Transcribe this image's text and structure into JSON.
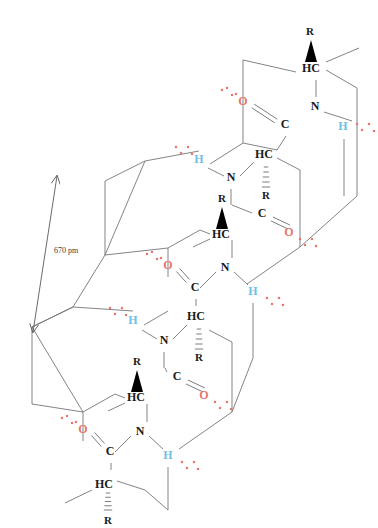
{
  "figure": {
    "type": "chemical-structure-diagram",
    "background_color": "#ffffff"
  },
  "colors": {
    "bond": "#6e6e72",
    "atom_carbon": "#1a1a1a",
    "atom_nitrogen": "#1a1a1a",
    "atom_oxygen": "#e8766d",
    "atom_hydrogen_bonded": "#6fc0e8",
    "lone_pair_dot": "#e8766d",
    "wedge": "#000000",
    "dimension_line": "#5a5a5a",
    "dimension_text": "#3a3a3a"
  },
  "dimension": {
    "label": "670 pm",
    "arrow_style": "double-headed",
    "from": [
      57,
      176
    ],
    "to": [
      33,
      332
    ]
  },
  "labels": {
    "R": "R",
    "HC": "HC",
    "C": "C",
    "N": "N",
    "O": "O",
    "H": "H"
  },
  "atoms": [
    {
      "id": "a1_R",
      "text": "R",
      "kind": "sidechain",
      "x": 310,
      "y": 32,
      "color": "#1a1a1a",
      "size": 11
    },
    {
      "id": "a1_HC",
      "text": "HC",
      "kind": "alpha-carbon",
      "x": 311,
      "y": 69,
      "color": "#1a1a1a",
      "size": 12
    },
    {
      "id": "a1_N",
      "text": "N",
      "kind": "nitrogen",
      "x": 315,
      "y": 107,
      "color": "#1a1a1a",
      "size": 12
    },
    {
      "id": "a1_H",
      "text": "H",
      "kind": "amide-hydrogen",
      "x": 343,
      "y": 127,
      "color": "#6fc0e8",
      "size": 12
    },
    {
      "id": "a1_O",
      "text": "O",
      "kind": "carbonyl-oxygen",
      "x": 243,
      "y": 102,
      "color": "#e8766d",
      "size": 12
    },
    {
      "id": "a1_C",
      "text": "C",
      "kind": "carbonyl-carbon",
      "x": 285,
      "y": 125,
      "color": "#1a1a1a",
      "size": 12
    },
    {
      "id": "a2_H",
      "text": "H",
      "kind": "amide-hydrogen",
      "x": 199,
      "y": 160,
      "color": "#6fc0e8",
      "size": 12
    },
    {
      "id": "a2_HC",
      "text": "HC",
      "kind": "alpha-carbon",
      "x": 264,
      "y": 155,
      "color": "#1a1a1a",
      "size": 12
    },
    {
      "id": "a2_N",
      "text": "N",
      "kind": "nitrogen",
      "x": 231,
      "y": 178,
      "color": "#1a1a1a",
      "size": 12
    },
    {
      "id": "a2_R",
      "text": "R",
      "kind": "sidechain",
      "x": 266,
      "y": 196,
      "color": "#1a1a1a",
      "size": 11
    },
    {
      "id": "a3_R",
      "text": "R",
      "kind": "sidechain",
      "x": 222,
      "y": 199,
      "color": "#1a1a1a",
      "size": 11
    },
    {
      "id": "a3_HC",
      "text": "HC",
      "kind": "alpha-carbon",
      "x": 221,
      "y": 235,
      "color": "#1a1a1a",
      "size": 12
    },
    {
      "id": "a3_C",
      "text": "C",
      "kind": "carbonyl-carbon",
      "x": 262,
      "y": 214,
      "color": "#1a1a1a",
      "size": 12
    },
    {
      "id": "a3_O",
      "text": "O",
      "kind": "carbonyl-oxygen",
      "x": 289,
      "y": 233,
      "color": "#e8766d",
      "size": 12
    },
    {
      "id": "a4_O",
      "text": "O",
      "kind": "carbonyl-oxygen",
      "x": 168,
      "y": 266,
      "color": "#e8766d",
      "size": 12
    },
    {
      "id": "a4_C",
      "text": "C",
      "kind": "carbonyl-carbon",
      "x": 195,
      "y": 288,
      "color": "#1a1a1a",
      "size": 12
    },
    {
      "id": "a4_N",
      "text": "N",
      "kind": "nitrogen",
      "x": 225,
      "y": 268,
      "color": "#1a1a1a",
      "size": 12
    },
    {
      "id": "a4_H",
      "text": "H",
      "kind": "amide-hydrogen",
      "x": 253,
      "y": 292,
      "color": "#6fc0e8",
      "size": 12
    },
    {
      "id": "a5_H",
      "text": "H",
      "kind": "amide-hydrogen",
      "x": 133,
      "y": 321,
      "color": "#6fc0e8",
      "size": 12
    },
    {
      "id": "a5_HC",
      "text": "HC",
      "kind": "alpha-carbon",
      "x": 196,
      "y": 317,
      "color": "#1a1a1a",
      "size": 12
    },
    {
      "id": "a5_N",
      "text": "N",
      "kind": "nitrogen",
      "x": 164,
      "y": 341,
      "color": "#1a1a1a",
      "size": 12
    },
    {
      "id": "a5_R",
      "text": "R",
      "kind": "sidechain",
      "x": 199,
      "y": 358,
      "color": "#1a1a1a",
      "size": 11
    },
    {
      "id": "a6_R",
      "text": "R",
      "kind": "sidechain",
      "x": 137,
      "y": 362,
      "color": "#1a1a1a",
      "size": 11
    },
    {
      "id": "a6_HC",
      "text": "HC",
      "kind": "alpha-carbon",
      "x": 136,
      "y": 398,
      "color": "#1a1a1a",
      "size": 12
    },
    {
      "id": "a6_C",
      "text": "C",
      "kind": "carbonyl-carbon",
      "x": 177,
      "y": 377,
      "color": "#1a1a1a",
      "size": 12
    },
    {
      "id": "a6_O",
      "text": "O",
      "kind": "carbonyl-oxygen",
      "x": 204,
      "y": 396,
      "color": "#e8766d",
      "size": 12
    },
    {
      "id": "a7_O",
      "text": "O",
      "kind": "carbonyl-oxygen",
      "x": 83,
      "y": 430,
      "color": "#e8766d",
      "size": 12
    },
    {
      "id": "a7_C",
      "text": "C",
      "kind": "carbonyl-carbon",
      "x": 110,
      "y": 452,
      "color": "#1a1a1a",
      "size": 12
    },
    {
      "id": "a7_N",
      "text": "N",
      "kind": "nitrogen",
      "x": 140,
      "y": 432,
      "color": "#1a1a1a",
      "size": 12
    },
    {
      "id": "a7_H",
      "text": "H",
      "kind": "amide-hydrogen",
      "x": 168,
      "y": 456,
      "color": "#6fc0e8",
      "size": 12
    },
    {
      "id": "a7_HC",
      "text": "HC",
      "kind": "alpha-carbon",
      "x": 104,
      "y": 485,
      "color": "#1a1a1a",
      "size": 12
    },
    {
      "id": "a7_R",
      "text": "R",
      "kind": "sidechain",
      "x": 108,
      "y": 521,
      "color": "#1a1a1a",
      "size": 11
    }
  ],
  "bonds": [
    {
      "from": [
        243,
        113
      ],
      "to": [
        243,
        60
      ],
      "style": "plain"
    },
    {
      "from": [
        243,
        60
      ],
      "to": [
        296,
        72
      ],
      "style": "plain"
    },
    {
      "from": [
        326,
        62
      ],
      "to": [
        359,
        48
      ],
      "style": "plain"
    },
    {
      "from": [
        316,
        80
      ],
      "to": [
        316,
        97
      ],
      "style": "plain"
    },
    {
      "from": [
        324,
        112
      ],
      "to": [
        352,
        121
      ],
      "style": "plain"
    },
    {
      "from": [
        326,
        70
      ],
      "to": [
        357,
        88
      ],
      "style": "plain"
    },
    {
      "from": [
        357,
        88
      ],
      "to": [
        357,
        196
      ],
      "style": "plain"
    },
    {
      "from": [
        344,
        139
      ],
      "to": [
        344,
        196
      ],
      "style": "plain"
    },
    {
      "from": [
        253,
        106
      ],
      "to": [
        276,
        121
      ],
      "style": "double"
    },
    {
      "from": [
        286,
        136
      ],
      "to": [
        277,
        150
      ],
      "style": "plain"
    },
    {
      "from": [
        243,
        113
      ],
      "to": [
        243,
        143
      ],
      "style": "plain"
    },
    {
      "from": [
        243,
        143
      ],
      "to": [
        277,
        150
      ],
      "style": "plain"
    },
    {
      "from": [
        210,
        164
      ],
      "to": [
        243,
        143
      ],
      "style": "plain"
    },
    {
      "from": [
        208,
        168
      ],
      "to": [
        224,
        176
      ],
      "style": "plain"
    },
    {
      "from": [
        240,
        176
      ],
      "to": [
        254,
        162
      ],
      "style": "plain"
    },
    {
      "from": [
        277,
        158
      ],
      "to": [
        300,
        170
      ],
      "style": "plain"
    },
    {
      "from": [
        266,
        167
      ],
      "to": [
        266,
        187
      ],
      "style": "hashed"
    },
    {
      "from": [
        231,
        189
      ],
      "to": [
        231,
        205
      ],
      "style": "plain"
    },
    {
      "from": [
        232,
        205
      ],
      "to": [
        252,
        213
      ],
      "style": "plain"
    },
    {
      "from": [
        272,
        219
      ],
      "to": [
        289,
        227
      ],
      "style": "double"
    },
    {
      "from": [
        168,
        277
      ],
      "to": [
        168,
        248
      ],
      "style": "plain"
    },
    {
      "from": [
        168,
        248
      ],
      "to": [
        200,
        230
      ],
      "style": "plain"
    },
    {
      "from": [
        200,
        230
      ],
      "to": [
        210,
        234
      ],
      "style": "plain"
    },
    {
      "from": [
        232,
        240
      ],
      "to": [
        232,
        258
      ],
      "style": "plain"
    },
    {
      "from": [
        210,
        239
      ],
      "to": [
        193,
        247
      ],
      "style": "plain"
    },
    {
      "from": [
        300,
        170
      ],
      "to": [
        300,
        247
      ],
      "style": "plain"
    },
    {
      "from": [
        300,
        247
      ],
      "to": [
        357,
        196
      ],
      "style": "plain"
    },
    {
      "from": [
        300,
        247
      ],
      "to": [
        247,
        284
      ],
      "style": "plain"
    },
    {
      "from": [
        178,
        270
      ],
      "to": [
        188,
        281
      ],
      "style": "double"
    },
    {
      "from": [
        196,
        299
      ],
      "to": [
        196,
        306
      ],
      "style": "plain"
    },
    {
      "from": [
        234,
        272
      ],
      "to": [
        248,
        285
      ],
      "style": "plain"
    },
    {
      "from": [
        216,
        272
      ],
      "to": [
        200,
        288
      ],
      "style": "plain"
    },
    {
      "from": [
        253,
        303
      ],
      "to": [
        253,
        358
      ],
      "style": "plain"
    },
    {
      "from": [
        144,
        325
      ],
      "to": [
        168,
        311
      ],
      "style": "plain"
    },
    {
      "from": [
        142,
        330
      ],
      "to": [
        157,
        339
      ],
      "style": "plain"
    },
    {
      "from": [
        173,
        339
      ],
      "to": [
        187,
        325
      ],
      "style": "plain"
    },
    {
      "from": [
        209,
        330
      ],
      "to": [
        232,
        342
      ],
      "style": "plain"
    },
    {
      "from": [
        199,
        329
      ],
      "to": [
        199,
        349
      ],
      "style": "hashed"
    },
    {
      "from": [
        164,
        352
      ],
      "to": [
        164,
        368
      ],
      "style": "plain"
    },
    {
      "from": [
        165,
        368
      ],
      "to": [
        167,
        372
      ],
      "style": "plain"
    },
    {
      "from": [
        187,
        382
      ],
      "to": [
        204,
        390
      ],
      "style": "double"
    },
    {
      "from": [
        83,
        441
      ],
      "to": [
        83,
        412
      ],
      "style": "plain"
    },
    {
      "from": [
        83,
        412
      ],
      "to": [
        115,
        394
      ],
      "style": "plain"
    },
    {
      "from": [
        115,
        394
      ],
      "to": [
        125,
        398
      ],
      "style": "plain"
    },
    {
      "from": [
        147,
        404
      ],
      "to": [
        147,
        422
      ],
      "style": "plain"
    },
    {
      "from": [
        125,
        403
      ],
      "to": [
        108,
        411
      ],
      "style": "plain"
    },
    {
      "from": [
        232,
        342
      ],
      "to": [
        232,
        412
      ],
      "style": "plain"
    },
    {
      "from": [
        232,
        412
      ],
      "to": [
        179,
        449
      ],
      "style": "plain"
    },
    {
      "from": [
        232,
        412
      ],
      "to": [
        253,
        358
      ],
      "style": "plain"
    },
    {
      "from": [
        93,
        434
      ],
      "to": [
        103,
        445
      ],
      "style": "double"
    },
    {
      "from": [
        111,
        463
      ],
      "to": [
        111,
        470
      ],
      "style": "plain"
    },
    {
      "from": [
        149,
        436
      ],
      "to": [
        163,
        449
      ],
      "style": "plain"
    },
    {
      "from": [
        131,
        436
      ],
      "to": [
        115,
        452
      ],
      "style": "plain"
    },
    {
      "from": [
        168,
        467
      ],
      "to": [
        168,
        510
      ],
      "style": "plain"
    },
    {
      "from": [
        117,
        481
      ],
      "to": [
        145,
        490
      ],
      "style": "plain"
    },
    {
      "from": [
        92,
        490
      ],
      "to": [
        65,
        503
      ],
      "style": "plain"
    },
    {
      "from": [
        108,
        493
      ],
      "to": [
        108,
        510
      ],
      "style": "hashed"
    },
    {
      "from": [
        145,
        490
      ],
      "to": [
        168,
        510
      ],
      "style": "plain"
    },
    {
      "from": [
        105,
        181
      ],
      "to": [
        145,
        161
      ],
      "style": "plain"
    },
    {
      "from": [
        105,
        181
      ],
      "to": [
        105,
        255
      ],
      "style": "plain"
    },
    {
      "from": [
        105,
        255
      ],
      "to": [
        145,
        161
      ],
      "style": "plain"
    },
    {
      "from": [
        105,
        255
      ],
      "to": [
        168,
        248
      ],
      "style": "plain"
    },
    {
      "from": [
        32,
        327
      ],
      "to": [
        73,
        307
      ],
      "style": "plain"
    },
    {
      "from": [
        32,
        327
      ],
      "to": [
        32,
        404
      ],
      "style": "plain"
    },
    {
      "from": [
        32,
        327
      ],
      "to": [
        73,
        307
      ],
      "style": "plain"
    },
    {
      "from": [
        73,
        307
      ],
      "to": [
        105,
        255
      ],
      "style": "plain"
    },
    {
      "from": [
        32,
        404
      ],
      "to": [
        83,
        412
      ],
      "style": "plain"
    },
    {
      "from": [
        73,
        307
      ],
      "to": [
        133,
        311
      ],
      "style": "plain"
    },
    {
      "from": [
        145,
        161
      ],
      "to": [
        199,
        151
      ],
      "style": "plain"
    },
    {
      "from": [
        32,
        327
      ],
      "to": [
        83,
        412
      ],
      "style": "plain"
    }
  ],
  "wedges": [
    {
      "id": "w1",
      "tip": [
        311,
        40
      ],
      "base_left": [
        305,
        62
      ],
      "base_right": [
        317,
        62
      ],
      "bonded_to": "a1_HC"
    },
    {
      "id": "w2",
      "tip": [
        222,
        207
      ],
      "base_left": [
        216,
        229
      ],
      "base_right": [
        228,
        229
      ],
      "bonded_to": "a3_HC"
    },
    {
      "id": "w3",
      "tip": [
        137,
        370
      ],
      "base_left": [
        131,
        392
      ],
      "base_right": [
        143,
        392
      ],
      "bonded_to": "a6_HC"
    }
  ],
  "hashed_bonds": [
    {
      "id": "h1",
      "from": [
        266,
        167
      ],
      "to": [
        266,
        187
      ],
      "bonded_to": "a2_R"
    },
    {
      "id": "h2",
      "from": [
        199,
        329
      ],
      "to": [
        199,
        349
      ],
      "bonded_to": "a5_R"
    },
    {
      "id": "h3",
      "from": [
        108,
        493
      ],
      "to": [
        108,
        510
      ],
      "bonded_to": "a7_R"
    }
  ],
  "lone_pair_groups": [
    {
      "id": "lp1",
      "atom": "a1_O",
      "dots": [
        [
          222,
          90
        ],
        [
          227,
          88
        ],
        [
          232,
          95
        ],
        [
          236,
          94
        ]
      ]
    },
    {
      "id": "lp2",
      "atom": "a1_H",
      "dots": [
        [
          357,
          124
        ],
        [
          362,
          130
        ],
        [
          369,
          124
        ],
        [
          374,
          131
        ]
      ]
    },
    {
      "id": "lp3",
      "atom": "a2_H",
      "dots": [
        [
          176,
          147
        ],
        [
          181,
          153
        ],
        [
          188,
          147
        ],
        [
          192,
          154
        ]
      ]
    },
    {
      "id": "lp4",
      "atom": "a3_O",
      "dots": [
        [
          300,
          239
        ],
        [
          305,
          245
        ],
        [
          312,
          239
        ],
        [
          316,
          246
        ]
      ]
    },
    {
      "id": "lp5",
      "atom": "a4_O",
      "dots": [
        [
          147,
          254
        ],
        [
          152,
          252
        ],
        [
          157,
          259
        ],
        [
          161,
          258
        ]
      ]
    },
    {
      "id": "lp6",
      "atom": "a4_H",
      "dots": [
        [
          267,
          298
        ],
        [
          272,
          304
        ],
        [
          279,
          298
        ],
        [
          283,
          305
        ]
      ]
    },
    {
      "id": "lp7",
      "atom": "a5_H",
      "dots": [
        [
          110,
          308
        ],
        [
          115,
          314
        ],
        [
          122,
          308
        ],
        [
          126,
          315
        ]
      ]
    },
    {
      "id": "lp8",
      "atom": "a6_O",
      "dots": [
        [
          215,
          402
        ],
        [
          220,
          408
        ],
        [
          227,
          402
        ],
        [
          231,
          409
        ]
      ]
    },
    {
      "id": "lp9",
      "atom": "a7_O",
      "dots": [
        [
          62,
          418
        ],
        [
          67,
          416
        ],
        [
          72,
          423
        ],
        [
          76,
          422
        ]
      ]
    },
    {
      "id": "lp10",
      "atom": "a7_H",
      "dots": [
        [
          182,
          462
        ],
        [
          187,
          468
        ],
        [
          194,
          462
        ],
        [
          198,
          469
        ]
      ]
    }
  ]
}
